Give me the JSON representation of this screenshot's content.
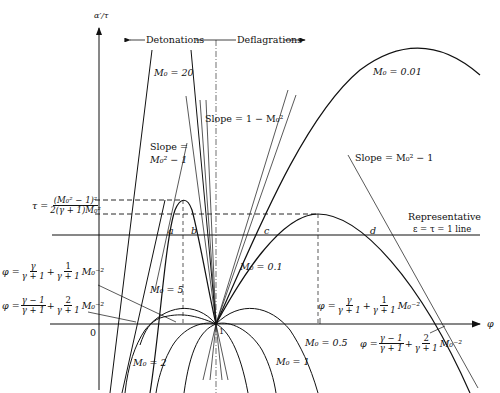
{
  "diagram": {
    "y_axis_label": "α′/τ",
    "x_axis_label": "φ",
    "origin_label": "0",
    "unit_label": "1",
    "regions": {
      "left": "Detonations",
      "right": "Deflagrations"
    },
    "curve_labels": {
      "m20": "M₀ = 20",
      "m5": "M₀ = 5",
      "m2": "M₀ = 2",
      "m1": "M₀ = 1",
      "m05": "M₀ = 0.5",
      "m01": "M₀ = 0.1",
      "m001": "M₀ = 0.01"
    },
    "slope_labels": {
      "one_minus": "Slope = 1 − M₀²",
      "left_top": "Slope =",
      "left_bottom": "M₀² − 1",
      "right": "Slope = M₀² − 1"
    },
    "tau_label": {
      "prefix": "τ =",
      "numerator": "(M₀² − 1)²",
      "denominator": "2(γ + 1)M₀²"
    },
    "phi_formula_1": {
      "prefix": "φ =",
      "t1_num": "γ",
      "t1_den": "γ + 1",
      "plus": "+",
      "t2_num": "1",
      "t2_den": "γ + 1",
      "suffix": "M₀⁻²"
    },
    "phi_formula_2": {
      "prefix": "φ =",
      "t1_num": "γ − 1",
      "t1_den": "γ + 1",
      "plus": "+",
      "t2_num": "2",
      "t2_den": "γ + 1",
      "suffix": "M₀⁻²"
    },
    "points": {
      "a": "a",
      "b": "b",
      "c": "c",
      "d": "d"
    },
    "representative_line": {
      "line1": "Representative",
      "line2": "ε = τ = 1  line"
    }
  }
}
